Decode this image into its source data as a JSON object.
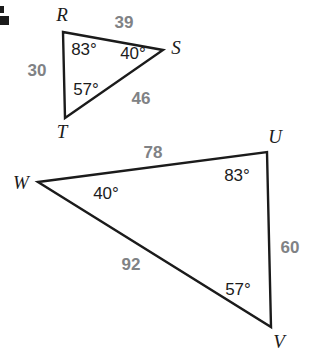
{
  "figure": {
    "stroke_color": "#1b1b1b",
    "side_label_color": "#808285",
    "angle_label_color": "#1b1b1b",
    "background_color": "#ffffff"
  },
  "triangle_rst": {
    "name": "triangle-rst",
    "vertices": [
      {
        "label": "R",
        "x": 63,
        "y": 32
      },
      {
        "label": "S",
        "x": 163,
        "y": 50
      },
      {
        "label": "T",
        "x": 65,
        "y": 118
      }
    ],
    "vertex_labels": [
      {
        "text": "R",
        "x": 62,
        "y": 14
      },
      {
        "text": "S",
        "x": 176,
        "y": 47
      },
      {
        "text": "T",
        "x": 62,
        "y": 131
      }
    ],
    "angles": [
      {
        "text": "83°",
        "at": "R",
        "x": 84,
        "y": 49
      },
      {
        "text": "40°",
        "at": "S",
        "x": 133,
        "y": 53
      },
      {
        "text": "57°",
        "at": "T",
        "x": 86,
        "y": 89
      }
    ],
    "sides": [
      {
        "text": "39",
        "between": "R-S",
        "x": 124,
        "y": 22
      },
      {
        "text": "30",
        "between": "R-T",
        "x": 37,
        "y": 70
      },
      {
        "text": "46",
        "between": "T-S",
        "x": 141,
        "y": 98
      }
    ]
  },
  "triangle_uvw": {
    "name": "triangle-uvw",
    "vertices": [
      {
        "label": "W",
        "x": 38,
        "y": 182
      },
      {
        "label": "U",
        "x": 267,
        "y": 152
      },
      {
        "label": "V",
        "x": 271,
        "y": 327
      }
    ],
    "vertex_labels": [
      {
        "text": "W",
        "x": 21,
        "y": 182
      },
      {
        "text": "U",
        "x": 275,
        "y": 136
      },
      {
        "text": "V",
        "x": 279,
        "y": 341
      }
    ],
    "angles": [
      {
        "text": "40°",
        "at": "W",
        "x": 106,
        "y": 193
      },
      {
        "text": "83°",
        "at": "U",
        "x": 237,
        "y": 175
      },
      {
        "text": "57°",
        "at": "V",
        "x": 238,
        "y": 289
      }
    ],
    "sides": [
      {
        "text": "78",
        "between": "W-U",
        "x": 153,
        "y": 152
      },
      {
        "text": "92",
        "between": "W-V",
        "x": 131,
        "y": 264
      },
      {
        "text": "60",
        "between": "U-V",
        "x": 290,
        "y": 247
      }
    ]
  },
  "chart_data": {
    "type": "diagram",
    "shapes": [
      {
        "name": "triangle-rst",
        "points": [
          [
            63,
            32
          ],
          [
            163,
            50
          ],
          [
            65,
            118
          ]
        ],
        "vertex_labels": [
          "R",
          "S",
          "T"
        ],
        "angle_measures_deg": [
          83,
          40,
          57
        ],
        "side_lengths": {
          "RS": 39,
          "RT": 30,
          "TS": 46
        }
      },
      {
        "name": "triangle-uvw",
        "points": [
          [
            38,
            182
          ],
          [
            267,
            152
          ],
          [
            271,
            327
          ]
        ],
        "vertex_labels": [
          "W",
          "U",
          "V"
        ],
        "angle_measures_deg": [
          40,
          83,
          57
        ],
        "side_lengths": {
          "WU": 78,
          "WV": 92,
          "UV": 60
        }
      }
    ]
  }
}
